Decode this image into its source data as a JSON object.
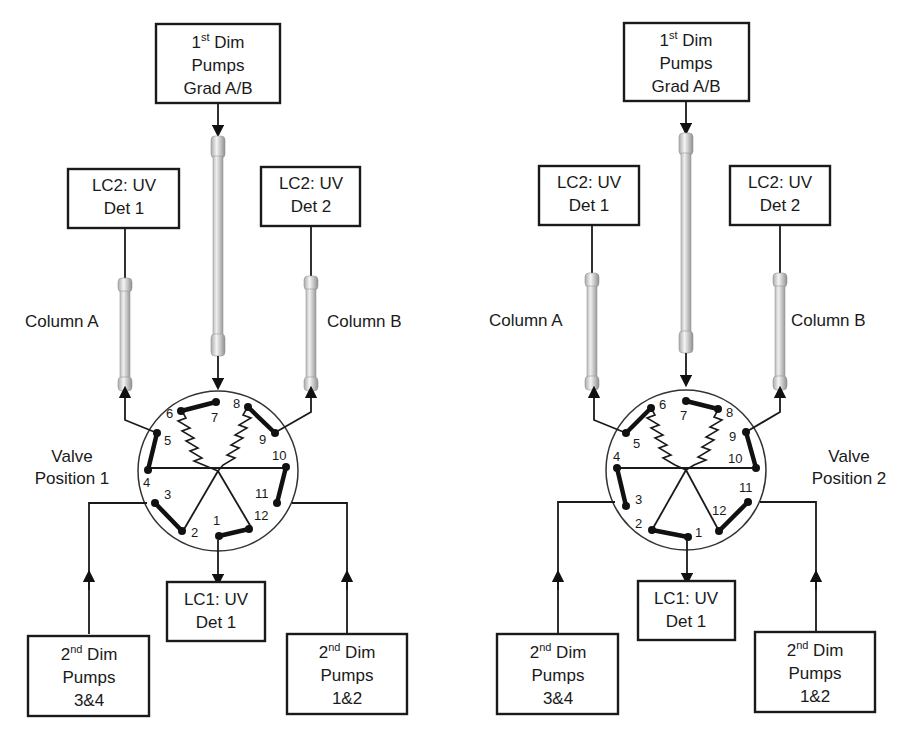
{
  "diagrams": [
    {
      "valve_label": [
        "Valve",
        "Position 1"
      ],
      "first_dim_box": {
        "line1_main": "1",
        "line1_sup": "st",
        "line1_rest": " Dim",
        "line2": "Pumps",
        "line3": "Grad A/B"
      },
      "lc2_det1_box": {
        "line1": "LC2: UV",
        "line2": "Det 1"
      },
      "lc2_det2_box": {
        "line1": "LC2: UV",
        "line2": "Det 2"
      },
      "column_a_label": "Column A",
      "column_b_label": "Column B",
      "lc1_det1_box": {
        "line1": "LC1: UV",
        "line2": "Det 1"
      },
      "second_dim_34_box": {
        "line1_main": "2",
        "line1_sup": "nd",
        "line1_rest": " Dim",
        "line2": "Pumps",
        "line3": "3&4"
      },
      "second_dim_12_box": {
        "line1_main": "2",
        "line1_sup": "nd",
        "line1_rest": " Dim",
        "line2": "Pumps",
        "line3": "1&2"
      },
      "ports": [
        "1",
        "2",
        "3",
        "4",
        "5",
        "6",
        "7",
        "8",
        "9",
        "10",
        "11",
        "12"
      ],
      "connections": [
        [
          6,
          7
        ],
        [
          8,
          9
        ],
        [
          4,
          5
        ],
        [
          2,
          3
        ],
        [
          10,
          11
        ],
        [
          12,
          1
        ]
      ]
    },
    {
      "valve_label": [
        "Valve",
        "Position 2"
      ],
      "first_dim_box": {
        "line1_main": "1",
        "line1_sup": "st",
        "line1_rest": " Dim",
        "line2": "Pumps",
        "line3": "Grad A/B"
      },
      "lc2_det1_box": {
        "line1": "LC2: UV",
        "line2": "Det 1"
      },
      "lc2_det2_box": {
        "line1": "LC2: UV",
        "line2": "Det 2"
      },
      "column_a_label": "Column A",
      "column_b_label": "Column B",
      "lc1_det1_box": {
        "line1": "LC1: UV",
        "line2": "Det 1"
      },
      "second_dim_34_box": {
        "line1_main": "2",
        "line1_sup": "nd",
        "line1_rest": " Dim",
        "line2": "Pumps",
        "line3": "3&4"
      },
      "second_dim_12_box": {
        "line1_main": "2",
        "line1_sup": "nd",
        "line1_rest": " Dim",
        "line2": "Pumps",
        "line3": "1&2"
      },
      "ports": [
        "1",
        "2",
        "3",
        "4",
        "5",
        "6",
        "7",
        "8",
        "9",
        "10",
        "11",
        "12"
      ],
      "connections": [
        [
          7,
          8
        ],
        [
          5,
          6
        ],
        [
          9,
          10
        ],
        [
          3,
          4
        ],
        [
          1,
          2
        ],
        [
          11,
          12
        ]
      ]
    }
  ]
}
